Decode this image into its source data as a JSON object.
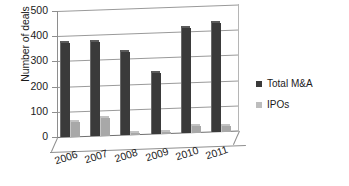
{
  "chart_data": {
    "type": "bar",
    "title": "",
    "xlabel": "",
    "ylabel": "Number of deals",
    "categories": [
      "2006",
      "2007",
      "2008",
      "2009",
      "2010",
      "2011"
    ],
    "series": [
      {
        "name": "Total M&A",
        "color": "#3a3a3a",
        "values": [
          375,
          372,
          330,
          240,
          415,
          432
        ]
      },
      {
        "name": "IPOs",
        "color": "#a8a8a8",
        "values": [
          58,
          70,
          8,
          8,
          25,
          22
        ]
      }
    ],
    "ylim": [
      0,
      500
    ],
    "yticks": [
      "0",
      "100",
      "200",
      "300",
      "400",
      "500"
    ],
    "ytick_values": [
      0,
      100,
      200,
      300,
      400,
      500
    ],
    "grid": true,
    "legend_position": "right",
    "style": "3d-column"
  },
  "legend": {
    "items": [
      {
        "label": "Total M&A"
      },
      {
        "label": "IPOs"
      }
    ]
  },
  "axis": {
    "y_title": "Number of deals"
  }
}
